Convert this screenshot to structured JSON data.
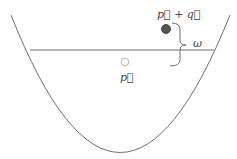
{
  "diagram": {
    "labels": {
      "p_plus_q": "p⃗ + q⃗",
      "p": "p⃗",
      "omega": "ω"
    },
    "elements": {
      "parabola": "dispersion curve",
      "horizontal_line": "energy level",
      "filled_point": "p+q state (occupied)",
      "open_point": "p state (hole)",
      "brace": "energy gap omega"
    },
    "colors": {
      "line": "#6e6e6e",
      "filled_point": "#555555",
      "open_point_stroke": "#b0b0b0",
      "text": "#444444"
    }
  }
}
